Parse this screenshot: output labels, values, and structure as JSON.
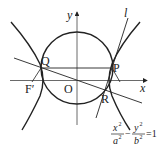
{
  "diagram": {
    "type": "geometry",
    "axes": {
      "x_label": "x",
      "y_label": "y",
      "origin_label": "O"
    },
    "points": {
      "Q": "Q",
      "P": "P",
      "R": "R",
      "F_left": "F′",
      "F_right": "F",
      "O": "O"
    },
    "line_label": "l",
    "equation": {
      "lhs_num1": "x",
      "lhs_exp1": "2",
      "lhs_den1": "a",
      "lhs_den_exp1": "2",
      "minus": "−",
      "lhs_num2": "y",
      "lhs_exp2": "2",
      "lhs_den2": "b",
      "lhs_den_exp2": "2",
      "equals": "=1"
    },
    "colors": {
      "stroke": "#222222",
      "background": "#ffffff"
    }
  }
}
